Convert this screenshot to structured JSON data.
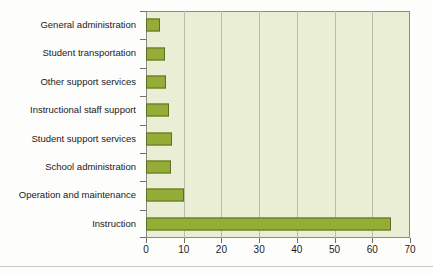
{
  "chart_data": {
    "type": "bar",
    "orientation": "horizontal",
    "title": "",
    "subtitle": "",
    "xlabel": "",
    "ylabel": "",
    "xlim": [
      0,
      70
    ],
    "ylim": null,
    "grid": true,
    "legend": false,
    "legend_position": "none",
    "categories": [
      "General administration",
      "Student transportation",
      "Other support services",
      "Instructional staff support",
      "Student support services",
      "School administration",
      "Operation and maintenance",
      "Instruction"
    ],
    "values": [
      3.8,
      5.0,
      5.3,
      6.1,
      6.8,
      6.5,
      10.0,
      65.0
    ],
    "xticks": [
      0,
      10,
      20,
      30,
      40,
      50,
      60,
      70
    ],
    "xtick_labels": [
      "0",
      "10",
      "20",
      "30",
      "40",
      "50",
      "60",
      "70"
    ],
    "annotations": []
  },
  "style": {
    "bar_fill": "#94ad36",
    "bar_edge": "#5f6e25",
    "plot_background": "#e9eed4",
    "gridline_color": "#b9bcab",
    "axis_color": "#8a8a80",
    "text_color": "#1b1b1b",
    "page_background": "#fdfdfb"
  }
}
